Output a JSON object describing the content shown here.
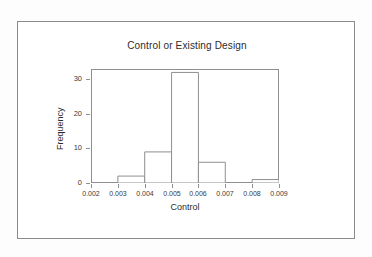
{
  "figure": {
    "title": "Control or Existing Design",
    "background_color": "#fdfdfd",
    "plot_background_color": "#ffffff",
    "frame_color": "#8a8a8a",
    "axis_color": "#8f8f8f",
    "bar_outline_color": "#8f8f8f",
    "bar_fill_color": "#ffffff"
  },
  "chart_data": {
    "type": "bar",
    "title": "Control or Existing Design",
    "xlabel": "Control",
    "ylabel": "Frequency",
    "xlim": [
      0.002,
      0.009
    ],
    "ylim": [
      0,
      33
    ],
    "grid": false,
    "legend": "none",
    "bin_width": 0.001,
    "bin_edges": [
      0.002,
      0.003,
      0.004,
      0.005,
      0.006,
      0.007,
      0.008,
      0.009
    ],
    "categories": [
      "0.002-0.003",
      "0.003-0.004",
      "0.004-0.005",
      "0.005-0.006",
      "0.006-0.007",
      "0.007-0.008",
      "0.008-0.009"
    ],
    "values": [
      0,
      2,
      9,
      32,
      6,
      0,
      1
    ],
    "x_ticks": [
      0.002,
      0.003,
      0.004,
      0.005,
      0.006,
      0.007,
      0.008,
      0.009
    ],
    "x_tick_labels": [
      "0.002",
      "0.003",
      "0.004",
      "0.005",
      "0.006",
      "0.007",
      "0.008",
      "0.009"
    ],
    "y_ticks": [
      0,
      10,
      20,
      30
    ],
    "y_tick_labels": [
      "0",
      "10",
      "20",
      "30"
    ]
  }
}
